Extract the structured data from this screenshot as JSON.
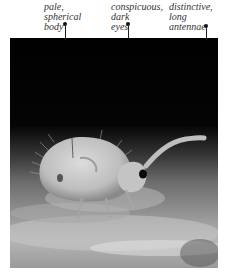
{
  "annotations": [
    {
      "id": "body",
      "lines": [
        "pale,",
        "spherical",
        "body"
      ]
    },
    {
      "id": "eyes",
      "lines": [
        "conspicuous,",
        "dark",
        "eyes"
      ]
    },
    {
      "id": "antennae",
      "lines": [
        "distinctive,",
        "long",
        "antennae"
      ]
    }
  ],
  "photo": {
    "subject": "springtail",
    "background_color": "#000000",
    "body_color": "#c8c8c8"
  }
}
